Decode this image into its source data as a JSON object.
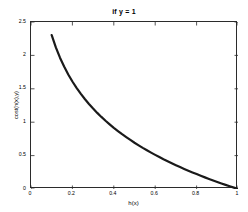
{
  "chart_data": {
    "type": "line",
    "title": "if y = 1",
    "xlabel": "h(x)",
    "ylabel": "cost(h(x),y)",
    "xlim": [
      0,
      1
    ],
    "ylim": [
      0,
      2.5
    ],
    "grid": false,
    "legend": null,
    "xticks": [
      "0",
      "0.2",
      "0.4",
      "0.6",
      "0.8",
      "1"
    ],
    "xtick_values": [
      0,
      0.2,
      0.4,
      0.6,
      0.8,
      1
    ],
    "yticks": [
      "0",
      "0.5",
      "1",
      "1.5",
      "2",
      "2.5"
    ],
    "ytick_values": [
      0,
      0.5,
      1,
      1.5,
      2,
      2.5
    ],
    "line_color": "#1a1a1a",
    "line_width": 2.2,
    "series": [
      {
        "name": "-log(h(x))",
        "x": [
          0.1,
          0.12,
          0.14,
          0.16,
          0.18,
          0.2,
          0.22,
          0.24,
          0.26,
          0.28,
          0.3,
          0.32,
          0.34,
          0.36,
          0.38,
          0.4,
          0.42,
          0.44,
          0.46,
          0.48,
          0.5,
          0.52,
          0.54,
          0.56,
          0.58,
          0.6,
          0.62,
          0.64,
          0.66,
          0.68,
          0.7,
          0.72,
          0.74,
          0.76,
          0.78,
          0.8,
          0.82,
          0.84,
          0.86,
          0.88,
          0.9,
          0.92,
          0.94,
          0.96,
          0.98,
          1.0
        ],
        "y": [
          2.303,
          2.12,
          1.966,
          1.833,
          1.715,
          1.609,
          1.514,
          1.427,
          1.347,
          1.273,
          1.204,
          1.139,
          1.079,
          1.022,
          0.968,
          0.916,
          0.868,
          0.821,
          0.777,
          0.734,
          0.693,
          0.654,
          0.616,
          0.58,
          0.545,
          0.511,
          0.478,
          0.446,
          0.416,
          0.386,
          0.357,
          0.329,
          0.301,
          0.274,
          0.248,
          0.223,
          0.198,
          0.174,
          0.151,
          0.128,
          0.105,
          0.083,
          0.062,
          0.041,
          0.02,
          0.0
        ]
      }
    ]
  },
  "axes": {
    "box_color": "#2b2b2b",
    "tick_color": "#2b2b2b",
    "background": "#ffffff"
  }
}
